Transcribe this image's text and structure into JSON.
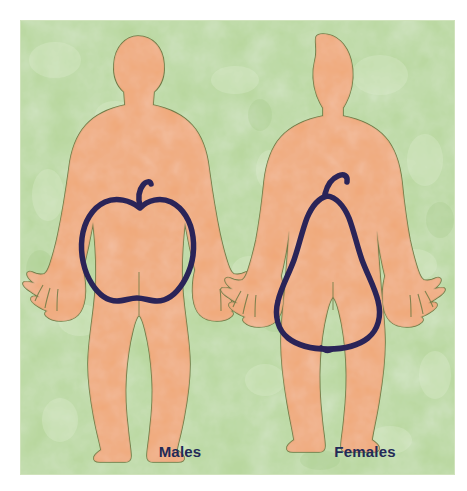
{
  "illustration": {
    "title": "Body fat distribution patterns",
    "description": "Two body silhouettes comparing fat distribution shapes",
    "background_color": "#b6d69b",
    "panel_border_color": "#cfe2bb",
    "skin_color": "#f0a878",
    "body_outline_color": "#6f7a45",
    "fruit_outline_color": "#2a2458",
    "label_color": "#232a57",
    "canvas": {
      "width": 467,
      "height": 491
    }
  },
  "figures": [
    {
      "id": "male",
      "label": "Males",
      "shape_name": "apple-shape",
      "shape_icon": "apple-outline-icon",
      "body_icon": "male-body-silhouette-icon",
      "label_x": 160,
      "label_y": 437
    },
    {
      "id": "female",
      "label": "Females",
      "shape_name": "pear-shape",
      "shape_icon": "pear-outline-icon",
      "body_icon": "female-body-silhouette-icon",
      "label_x": 345,
      "label_y": 437
    }
  ]
}
